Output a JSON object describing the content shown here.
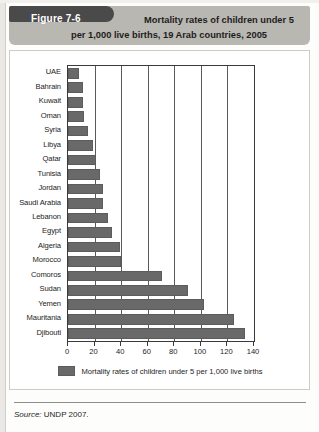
{
  "figure": {
    "tab_label": "Figure 7-6",
    "title_line1": "Mortality rates of children under 5",
    "title_line2": "per 1,000 live births, 19 Arab countries, 2005",
    "source_prefix": "Source:",
    "source_text": "UNDP 2007."
  },
  "legend": {
    "label": "Mortality rates of children under 5 per 1,000 live births",
    "swatch_color": "#696969",
    "position": "bottom-center"
  },
  "chart_data": {
    "type": "bar",
    "orientation": "horizontal",
    "title": "Mortality rates of children under 5 per 1,000 live births, 19 Arab countries, 2005",
    "xlabel": "",
    "ylabel": "",
    "xlim": [
      0,
      140
    ],
    "xticks": [
      0,
      20,
      40,
      60,
      80,
      100,
      120,
      140
    ],
    "xtick_labels": [
      "0",
      "20",
      "40",
      "60",
      "80",
      "100",
      "120",
      "140"
    ],
    "grid": true,
    "grid_axis": "x",
    "series_name": "Mortality rates of children under 5 per 1,000 live births",
    "bar_color": "#696969",
    "categories": [
      "UAE",
      "Bahrain",
      "Kuwait",
      "Oman",
      "Syria",
      "Libya",
      "Qatar",
      "Tunisia",
      "Jordan",
      "Saudi Arabia",
      "Lebanon",
      "Egypt",
      "Algeria",
      "Morocco",
      "Comoros",
      "Sudan",
      "Yemen",
      "Mauritania",
      "Djibouti"
    ],
    "values": [
      8,
      11,
      11,
      12,
      15,
      19,
      21,
      24,
      26,
      26,
      30,
      33,
      39,
      40,
      71,
      90,
      102,
      125,
      133
    ]
  }
}
